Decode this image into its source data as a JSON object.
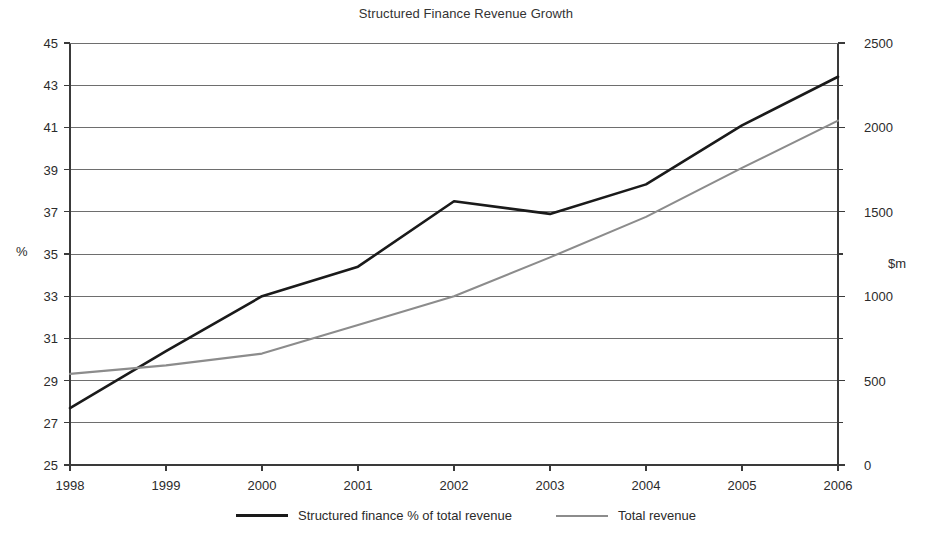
{
  "chart_data": {
    "type": "line",
    "title": "Structured Finance Revenue Growth",
    "xlabel": "",
    "ylabel": "%",
    "y2label": "$m",
    "categories": [
      "1998",
      "1999",
      "2000",
      "2001",
      "2002",
      "2003",
      "2004",
      "2005",
      "2006"
    ],
    "grid": true,
    "legend_position": "bottom",
    "ylim": [
      25,
      45
    ],
    "ytick_step": 2,
    "yticks": [
      25,
      27,
      29,
      31,
      33,
      35,
      37,
      39,
      41,
      43,
      45
    ],
    "y2lim": [
      0,
      2500
    ],
    "y2tick_step": 500,
    "y2ticks": [
      0,
      500,
      1000,
      1500,
      2000,
      2500
    ],
    "y2minor_step": 250,
    "series": [
      {
        "name": "Structured finance % of total revenue",
        "axis": "left",
        "unit": "%",
        "color": "#1a1a1a",
        "values": [
          27.7,
          30.4,
          33.0,
          34.4,
          37.5,
          36.9,
          38.3,
          41.1,
          43.4
        ]
      },
      {
        "name": "Total revenue",
        "axis": "right",
        "unit": "$m",
        "color": "#8c8c8c",
        "values": [
          540,
          590,
          660,
          830,
          1000,
          1230,
          1470,
          1760,
          2040
        ]
      }
    ]
  },
  "legend": {
    "entries": [
      {
        "label": "Structured finance % of total revenue",
        "style": "primary"
      },
      {
        "label": "Total revenue",
        "style": "secondary"
      }
    ]
  },
  "colors": {
    "primary_series": "#1a1a1a",
    "secondary_series": "#8c8c8c",
    "gridline": "#6e6e6e",
    "axis": "#3a3a3a",
    "text": "#2b2b2b",
    "background": "#ffffff"
  }
}
